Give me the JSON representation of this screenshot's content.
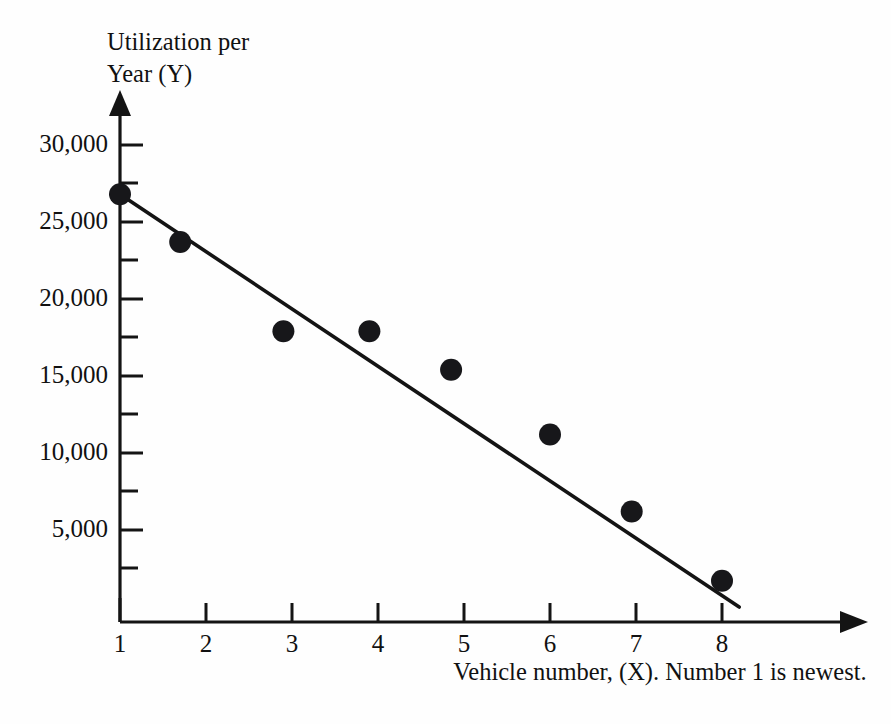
{
  "chart_data": {
    "type": "scatter",
    "title": "",
    "xlabel": "Vehicle number, (X).  Number 1 is newest.",
    "ylabel_line1": "Utilization per",
    "ylabel_line2": "Year (Y)",
    "x": [
      1,
      1.7,
      2.9,
      3.9,
      4.85,
      6.0,
      6.95,
      8.0
    ],
    "values": [
      26800,
      23700,
      17900,
      17900,
      15400,
      11200,
      6200,
      1700
    ],
    "points": [
      {
        "x": 1,
        "y": 26800
      },
      {
        "x": 1.7,
        "y": 23700
      },
      {
        "x": 2.9,
        "y": 17900
      },
      {
        "x": 3.9,
        "y": 17900
      },
      {
        "x": 4.85,
        "y": 15400
      },
      {
        "x": 6.0,
        "y": 11200
      },
      {
        "x": 6.95,
        "y": 6200
      },
      {
        "x": 8.0,
        "y": 1700
      }
    ],
    "trend_line": {
      "label": "fitted regression line",
      "x_start": 1.0,
      "y_start": 26800,
      "x_end": 8.2,
      "y_end": 0
    },
    "xlim": [
      1,
      8.6
    ],
    "ylim": [
      0,
      31500
    ],
    "xticks": [
      1,
      2,
      3,
      4,
      5,
      6,
      7,
      8
    ],
    "xtick_labels": [
      "1",
      "2",
      "3",
      "4",
      "5",
      "6",
      "7",
      "8"
    ],
    "yticks": [
      5000,
      10000,
      15000,
      20000,
      25000,
      30000
    ],
    "ytick_labels": [
      "5,000",
      "10,000",
      "15,000",
      "20,000",
      "25,000",
      "30,000"
    ],
    "y_minor_ticks": [
      2500,
      7500,
      12500,
      17500,
      22500,
      27500
    ],
    "grid": false,
    "legend": null,
    "marker": {
      "shape": "circle",
      "color": "#17171a",
      "radius": 11
    },
    "line_color": "#141414",
    "axis_color": "#141414",
    "background": "#fefefe"
  }
}
